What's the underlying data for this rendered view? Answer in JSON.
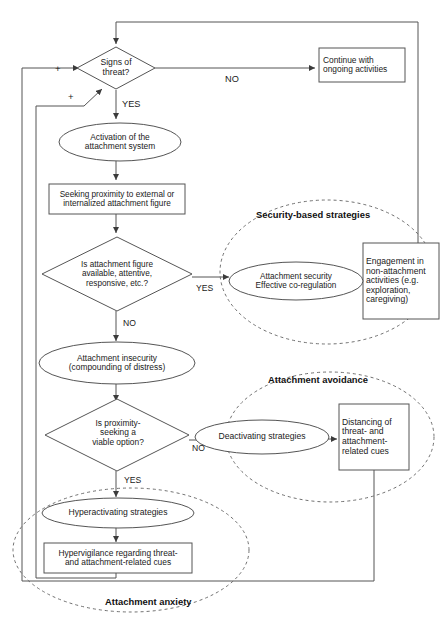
{
  "diagram": {
    "type": "flowchart",
    "title": "",
    "nodes": [
      {
        "id": "signs_of_threat",
        "shape": "diamond",
        "text": "Signs of\nthreat?",
        "x": 116,
        "y": 68,
        "w": 78,
        "h": 42,
        "font": 8.6
      },
      {
        "id": "continue_ongoing",
        "shape": "rect",
        "text": "Continue with\nongoing activities",
        "x": 362,
        "y": 65,
        "w": 86,
        "h": 34,
        "font": 8.4
      },
      {
        "id": "activation_attachment",
        "shape": "ellipse",
        "text": "Activation of the\nattachment system",
        "x": 120,
        "y": 142,
        "w": 122,
        "h": 38,
        "font": 8.4
      },
      {
        "id": "seeking_proximity",
        "shape": "rect",
        "text": "Seeking proximity to external or\ninternalized attachment figure",
        "x": 117,
        "y": 199,
        "w": 136,
        "h": 30,
        "font": 8.2
      },
      {
        "id": "is_attachment_figure",
        "shape": "diamond",
        "text": "Is attachment figure\navailable, attentive,\nresponsive, etc.?",
        "x": 117,
        "y": 274,
        "w": 150,
        "h": 74,
        "font": 8.2
      },
      {
        "id": "attachment_security",
        "shape": "ellipse",
        "text": "Attachment security\nEffective co-regulation",
        "x": 298,
        "y": 281,
        "w": 130,
        "h": 36,
        "font": 8.2
      },
      {
        "id": "engagement_nonattachment",
        "shape": "rect",
        "text": "Engagement in\nnon-attachment\nactivities (e.g.\nexploration,\ncaregiving)",
        "x": 401,
        "y": 281,
        "w": 76,
        "h": 76,
        "font": 8.6
      },
      {
        "id": "attachment_insecurity",
        "shape": "ellipse",
        "text": "Attachment insecurity\n(compounding of distress)",
        "x": 117,
        "y": 363,
        "w": 156,
        "h": 40,
        "font": 8.4
      },
      {
        "id": "is_proximity_seeking",
        "shape": "diamond",
        "text": "Is proximity-\nseeking a\nviable option?",
        "x": 117,
        "y": 435,
        "w": 144,
        "h": 72,
        "font": 8.4
      },
      {
        "id": "deactivating_strategies",
        "shape": "ellipse",
        "text": "Deactivating strategies",
        "x": 296,
        "y": 437,
        "w": 134,
        "h": 34,
        "font": 8.6
      },
      {
        "id": "distancing_threat",
        "shape": "rect",
        "text": "Distancing of\nthreat- and\nattachment-\nrelated cues",
        "x": 374,
        "y": 437,
        "w": 70,
        "h": 66,
        "font": 8.6
      },
      {
        "id": "hyperactivating_strategies",
        "shape": "ellipse",
        "text": "Hyperactivating strategies",
        "x": 118,
        "y": 513,
        "w": 152,
        "h": 28,
        "font": 8.6
      },
      {
        "id": "hypervigilance",
        "shape": "rect",
        "text": "Hypervigilance regarding threat-\nand attachment-related cues",
        "x": 118,
        "y": 558,
        "w": 148,
        "h": 30,
        "font": 8.4
      }
    ],
    "edge_labels": [
      {
        "id": "no_threat",
        "text": "NO",
        "x": 235,
        "y": 80,
        "font": 9.2
      },
      {
        "id": "yes_threat",
        "text": "YES",
        "x": 129,
        "y": 106,
        "font": 9.2
      },
      {
        "id": "yes_attachment_figure",
        "text": "YES",
        "x": 208,
        "y": 289,
        "font": 8.6
      },
      {
        "id": "no_attachment_figure",
        "text": "NO",
        "x": 130,
        "y": 325,
        "font": 8.6
      },
      {
        "id": "no_proximity",
        "text": "NO",
        "x": 205,
        "y": 448,
        "font": 8.6
      },
      {
        "id": "yes_proximity",
        "text": "YES",
        "x": 132,
        "y": 481,
        "font": 8.6
      }
    ],
    "plus_markers": [
      {
        "id": "plus-upper",
        "text": "+",
        "x": 60,
        "y": 71,
        "font": 9.5
      },
      {
        "id": "plus-lower",
        "text": "+",
        "x": 72,
        "y": 98,
        "font": 9.5
      }
    ],
    "group_labels": [
      {
        "id": "security-based-strategies",
        "text": "Security-based strategies",
        "x": 325,
        "y": 216,
        "font": 9.4
      },
      {
        "id": "attachment-avoidance",
        "text": "Attachment avoidance",
        "x": 330,
        "y": 380,
        "font": 9.4
      },
      {
        "id": "attachment-anxiety",
        "text": "Attachment anxiety",
        "x": 157,
        "y": 602,
        "font": 9.4
      }
    ],
    "group_outlines": [
      {
        "id": "security-based-strategies-outline",
        "cx": 327,
        "cy": 272,
        "rx": 107,
        "ry": 72
      },
      {
        "id": "attachment-avoidance-outline",
        "cx": 330,
        "cy": 437,
        "rx": 104,
        "ry": 65
      },
      {
        "id": "attachment-anxiety-outline",
        "cx": 131,
        "cy": 550,
        "rx": 118,
        "ry": 62
      }
    ],
    "colors": {
      "stroke": "#555555",
      "stroke_dark": "#3b3b3b",
      "text": "#1a1a1a",
      "background": "#ffffff"
    }
  }
}
